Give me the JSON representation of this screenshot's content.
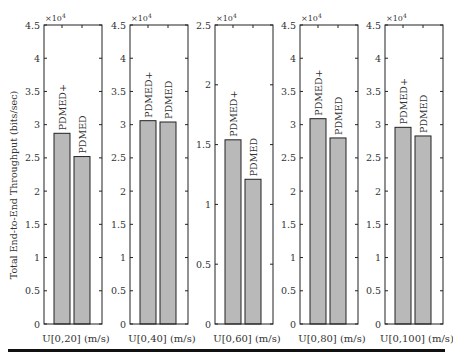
{
  "chart_data": {
    "type": "bar",
    "ylabel": "Total End-to-End Throughput (bits/sec)",
    "y_multiplier": "×10^4",
    "legend": null,
    "grid": false,
    "bar_color": "#b9b9b9",
    "bar_edge_color": "#222222",
    "panels": [
      {
        "xlabel": "U[0,20] (m/s)",
        "ylim": [
          0,
          4.5
        ],
        "yticks": [
          0,
          0.5,
          1,
          1.5,
          2,
          2.5,
          3,
          3.5,
          4,
          4.5
        ],
        "categories": [
          "PDMED+",
          "PDMED"
        ],
        "values": [
          2.87,
          2.52
        ]
      },
      {
        "xlabel": "U[0,40] (m/s)",
        "ylim": [
          0,
          4.5
        ],
        "yticks": [
          0,
          0.5,
          1,
          1.5,
          2,
          2.5,
          3,
          3.5,
          4,
          4.5
        ],
        "categories": [
          "PDMED+",
          "PDMED"
        ],
        "values": [
          3.06,
          3.04
        ]
      },
      {
        "xlabel": "U[0,60] (m/s)",
        "ylim": [
          0,
          2.5
        ],
        "yticks": [
          0,
          0.5,
          1,
          1.5,
          2,
          2.5
        ],
        "categories": [
          "PDMED+",
          "PDMED"
        ],
        "values": [
          1.54,
          1.21
        ]
      },
      {
        "xlabel": "U[0,80] (m/s)",
        "ylim": [
          0,
          4.5
        ],
        "yticks": [
          0,
          0.5,
          1,
          1.5,
          2,
          2.5,
          3,
          3.5,
          4,
          4.5
        ],
        "categories": [
          "PDMED+",
          "PDMED"
        ],
        "values": [
          3.09,
          2.8
        ]
      },
      {
        "xlabel": "U[0,100] (m/s)",
        "ylim": [
          0,
          4.5
        ],
        "yticks": [
          0,
          0.5,
          1,
          1.5,
          2,
          2.5,
          3,
          3.5,
          4,
          4.5
        ],
        "categories": [
          "PDMED+",
          "PDMED"
        ],
        "values": [
          2.96,
          2.83
        ]
      }
    ]
  },
  "figure": {
    "ylabel": "Total End-to-End Throughput (bits/sec)",
    "exponent_base": "×10",
    "exponent_power": "4"
  }
}
